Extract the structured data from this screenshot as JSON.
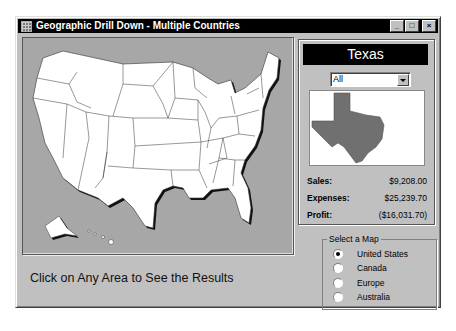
{
  "window": {
    "title": "Geographic Drill Down - Multiple Countries",
    "controls": {
      "minimize": "_",
      "maximize": "□",
      "close": "×"
    }
  },
  "map": {
    "country": "United States",
    "selected_state": "Texas",
    "instructions": "Click on Any Area to See the Results"
  },
  "detail_panel": {
    "state_name": "Texas",
    "filter_dropdown": {
      "selected": "All"
    },
    "metrics": [
      {
        "label": "Sales:",
        "value": "$9,208.00"
      },
      {
        "label": "Expenses:",
        "value": "$25,239.70"
      },
      {
        "label": "Profit:",
        "value": "($16,031.70)"
      }
    ]
  },
  "map_selector": {
    "legend": "Select a Map",
    "options": [
      {
        "label": "United States",
        "checked": true
      },
      {
        "label": "Canada",
        "checked": false
      },
      {
        "label": "Europe",
        "checked": false
      },
      {
        "label": "Australia",
        "checked": false
      }
    ]
  },
  "colors": {
    "window_bg": "#c0c0c0",
    "titlebar": "#000000",
    "map_bg": "#a7a7a7",
    "state_fill": "#ffffff",
    "selected_state_fill": "#707070"
  }
}
